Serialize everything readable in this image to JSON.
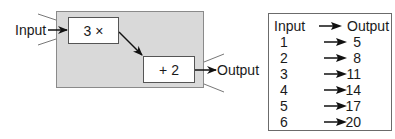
{
  "diagram": {
    "machine": {
      "input_label": "Input",
      "output_label": "Output",
      "background_color": "#d9d9d9",
      "steps": [
        {
          "label": "3 ×",
          "operation": "multiply",
          "operand": 3
        },
        {
          "label": "+ 2",
          "operation": "add",
          "operand": 2
        }
      ]
    },
    "table": {
      "header": {
        "input": "Input",
        "output": "Output"
      },
      "arrow_icon": "right-arrow-icon",
      "rows": [
        {
          "input": "1",
          "output": "5"
        },
        {
          "input": "2",
          "output": "8"
        },
        {
          "input": "3",
          "output": "11"
        },
        {
          "input": "4",
          "output": "14"
        },
        {
          "input": "5",
          "output": "17"
        },
        {
          "input": "6",
          "output": "20"
        }
      ]
    }
  }
}
